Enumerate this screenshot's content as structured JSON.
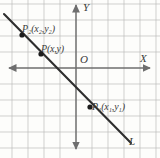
{
  "figure": {
    "background_color": "#fdfdfb",
    "grid_color": "#b9b9b9",
    "axis_color": "#6e6e6e",
    "line_color": "#2e2e2e",
    "label_color": "#3a3a3a"
  },
  "axes": {
    "x_label": "X",
    "y_label": "Y",
    "origin_label": "O",
    "x_axis_y_px": 68,
    "y_axis_x_px": 76,
    "arrows": [
      "left",
      "right",
      "up",
      "down"
    ]
  },
  "grid": {
    "spacing_px": 16,
    "x_origin_px": 76,
    "y_origin_px": 68,
    "visible": true
  },
  "line": {
    "label": "L",
    "from": [
      4,
      14
    ],
    "to": [
      129,
      141
    ],
    "slope_description": "negative"
  },
  "points": [
    {
      "id": "P2",
      "label_base": "P",
      "label_sub": "2",
      "label_coords": "(x₂,y₂)",
      "label_text": "P₂(x₂,y₂)",
      "x_px": 22,
      "y_px": 35
    },
    {
      "id": "P",
      "label_base": "P",
      "label_sub": "",
      "label_coords": "(x,y)",
      "label_text": "P(x,y)",
      "x_px": 41,
      "y_px": 54
    },
    {
      "id": "P1",
      "label_base": "P",
      "label_sub": "1",
      "label_coords": "(x₁,y₁)",
      "label_text": "P₁(x₁,y₁)",
      "x_px": 90,
      "y_px": 107
    }
  ],
  "point_labels": {
    "p2": {
      "base": "P",
      "sub": "2",
      "coords": "(x",
      "sub_a": "2",
      "mid": ",y",
      "sub_b": "2",
      "tail": ")"
    },
    "p": {
      "base": "P",
      "coords": "(x,y)"
    },
    "p1": {
      "base": "P",
      "sub": "1",
      "coords": "(x",
      "sub_a": "1",
      "mid": ",y",
      "sub_b": "1",
      "tail": ")"
    }
  }
}
